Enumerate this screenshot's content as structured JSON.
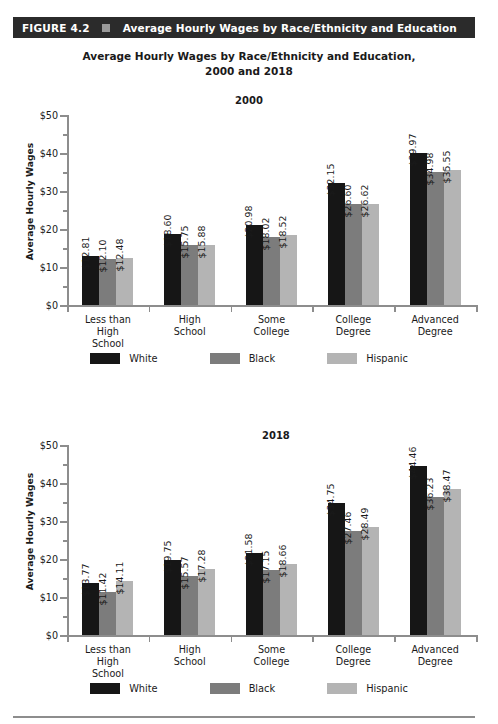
{
  "figure": {
    "number_label": "FIGURE 4.2",
    "bar_title": "Average Hourly Wages by Race/Ethnicity and Education",
    "marker_icon": "square-icon",
    "bar_color": "#2b2b2b",
    "marker_color": "#9a9a9a"
  },
  "main_title_line1": "Average Hourly Wages by Race/Ethnicity and Education,",
  "main_title_line2": "2000 and 2018",
  "series_colors": {
    "White": "#161616",
    "Black": "#7c7c7c",
    "Hispanic": "#b4b4b4"
  },
  "chart_data": [
    {
      "type": "bar",
      "title": "2000",
      "xlabel": "",
      "ylabel": "Average Hourly Wages",
      "ylim": [
        0,
        50
      ],
      "yticks": [
        "$0",
        "$10",
        "$20",
        "$30",
        "$40",
        "$50"
      ],
      "ytick_values": [
        0,
        10,
        20,
        30,
        40,
        50
      ],
      "grid": false,
      "legend_position": "bottom",
      "categories": [
        "Less than High School",
        "High School",
        "Some College",
        "College Degree",
        "Advanced Degree"
      ],
      "category_lines": [
        [
          "Less than",
          "High",
          "School"
        ],
        [
          "High",
          "School"
        ],
        [
          "Some",
          "College"
        ],
        [
          "College",
          "Degree"
        ],
        [
          "Advanced",
          "Degree"
        ]
      ],
      "series": [
        {
          "name": "White",
          "values": [
            12.81,
            18.6,
            20.98,
            32.15,
            39.97
          ],
          "labels": [
            "$12.81",
            "$18.60",
            "$20.98",
            "$32.15",
            "$39.97"
          ]
        },
        {
          "name": "Black",
          "values": [
            12.1,
            15.75,
            18.02,
            26.6,
            34.98
          ],
          "labels": [
            "$12.10",
            "$15.75",
            "$18.02",
            "$26.60",
            "$34.98"
          ]
        },
        {
          "name": "Hispanic",
          "values": [
            12.48,
            15.88,
            18.52,
            26.62,
            35.55
          ],
          "labels": [
            "$12.48",
            "$15.88",
            "$18.52",
            "$26.62",
            "$35.55"
          ]
        }
      ]
    },
    {
      "type": "bar",
      "title": "2018",
      "xlabel": "",
      "ylabel": "Average Hourly Wages",
      "ylim": [
        0,
        50
      ],
      "yticks": [
        "$0",
        "$10",
        "$20",
        "$30",
        "$40",
        "$50"
      ],
      "ytick_values": [
        0,
        10,
        20,
        30,
        40,
        50
      ],
      "grid": false,
      "legend_position": "bottom",
      "categories": [
        "Less than High School",
        "High School",
        "Some College",
        "College Degree",
        "Advanced Degree"
      ],
      "category_lines": [
        [
          "Less than",
          "High",
          "School"
        ],
        [
          "High",
          "School"
        ],
        [
          "Some",
          "College"
        ],
        [
          "College",
          "Degree"
        ],
        [
          "Advanced",
          "Degree"
        ]
      ],
      "series": [
        {
          "name": "White",
          "values": [
            13.77,
            19.75,
            21.58,
            34.75,
            44.46
          ],
          "labels": [
            "$13.77",
            "$19.75",
            "$21.58",
            "$34.75",
            "$44.46"
          ]
        },
        {
          "name": "Black",
          "values": [
            11.42,
            15.57,
            17.15,
            27.46,
            36.23
          ],
          "labels": [
            "$11.42",
            "$15.57",
            "$17.15",
            "$27.46",
            "$36.23"
          ]
        },
        {
          "name": "Hispanic",
          "values": [
            14.11,
            17.28,
            18.66,
            28.49,
            38.47
          ],
          "labels": [
            "$14.11",
            "$17.28",
            "$18.66",
            "$28.49",
            "$38.47"
          ]
        }
      ]
    }
  ]
}
